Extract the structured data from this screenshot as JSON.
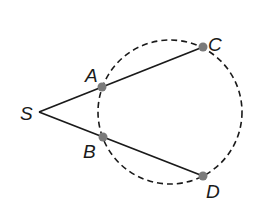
{
  "diagram": {
    "type": "geometry",
    "colors": {
      "line": "#1a1a1a",
      "circle": "#1a1a1a",
      "point": "#7a7a7a",
      "background": "#ffffff"
    },
    "circle": {
      "cx": 170,
      "cy": 112,
      "r": 72,
      "style": "dashed"
    },
    "points": [
      {
        "id": "S",
        "label": "S",
        "x": 39,
        "y": 112,
        "label_x": 20,
        "label_y": 120
      },
      {
        "id": "A",
        "label": "A",
        "x": 102,
        "y": 87,
        "label_x": 85,
        "label_y": 82
      },
      {
        "id": "B",
        "label": "B",
        "x": 103,
        "y": 137,
        "label_x": 83,
        "label_y": 158
      },
      {
        "id": "C",
        "label": "C",
        "x": 203,
        "y": 47,
        "label_x": 208,
        "label_y": 51
      },
      {
        "id": "D",
        "label": "D",
        "x": 203,
        "y": 176,
        "label_x": 206,
        "label_y": 198
      }
    ],
    "segments": [
      {
        "from": "S",
        "to": "C"
      },
      {
        "from": "S",
        "to": "D"
      }
    ]
  }
}
